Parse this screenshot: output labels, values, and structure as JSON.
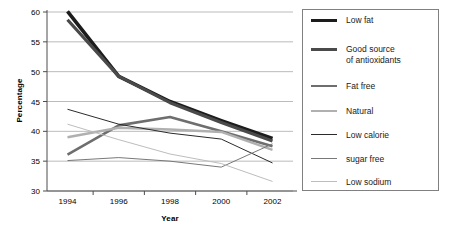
{
  "chart_data": {
    "type": "line",
    "title": "",
    "xlabel": "Year",
    "ylabel": "Percentage",
    "x": [
      1994,
      1996,
      1998,
      2000,
      2002
    ],
    "xtick_labels": [
      "1994",
      "1996",
      "1998",
      "2000",
      "2002"
    ],
    "ytick_labels": [
      "30",
      "35",
      "40",
      "45",
      "50",
      "55",
      "60"
    ],
    "yticks": [
      30,
      35,
      40,
      45,
      50,
      55,
      60
    ],
    "xlim": [
      1993.2,
      2002.8
    ],
    "ylim": [
      30,
      60
    ],
    "grid": "horizontal",
    "legend_position": "right-outside",
    "series": [
      {
        "name": "Low fat",
        "values": [
          60.1,
          49.2,
          45.0,
          41.8,
          38.8
        ],
        "color": "#1c1c1c",
        "width": 3.6
      },
      {
        "name": "Good source\nof antioxidants",
        "values": [
          58.7,
          49.2,
          44.8,
          41.5,
          38.4
        ],
        "color": "#4a4a4a",
        "width": 3.2
      },
      {
        "name": "Fat free",
        "values": [
          36.1,
          41.0,
          42.4,
          40.0,
          37.5
        ],
        "color": "#6e6e6e",
        "width": 2.6
      },
      {
        "name": "Natural",
        "values": [
          39.0,
          40.6,
          40.3,
          39.9,
          36.9
        ],
        "color": "#b0b0b0",
        "width": 2.4
      },
      {
        "name": "Low calorie",
        "values": [
          43.7,
          41.2,
          39.7,
          38.7,
          34.7
        ],
        "color": "#2b2b2b",
        "width": 1.0
      },
      {
        "name": "sugar free",
        "values": [
          35.1,
          35.6,
          35.0,
          34.0,
          37.9
        ],
        "color": "#787878",
        "width": 1.0
      },
      {
        "name": "Low sodium",
        "values": [
          41.2,
          38.6,
          36.2,
          34.6,
          31.6
        ],
        "color": "#bdbdbd",
        "width": 1.0
      }
    ],
    "colors": {
      "gridline": "#a9a9a9",
      "axis": "#4d4d4d",
      "legend_border": "#808080",
      "text": "#000000",
      "background": "#ffffff"
    }
  }
}
